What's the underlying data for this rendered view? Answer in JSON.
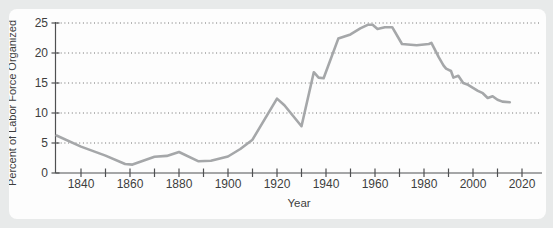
{
  "colors": {
    "page_background": "#e8eaea",
    "card_background": "#fdfdfd",
    "axis": "#4f5052",
    "grid_dots": "#6f6f6f",
    "text": "#3e3e3e",
    "series_line": "#a5a7a9"
  },
  "chart_data": {
    "type": "line",
    "title": "",
    "xlabel": "Year",
    "ylabel": "Percent of Labor Force Organized",
    "xlim": [
      1829,
      2028
    ],
    "ylim": [
      0,
      25
    ],
    "y_ticks": [
      0,
      5,
      10,
      15,
      20,
      25
    ],
    "x_minor_ticks": {
      "start": 1840,
      "end": 2020,
      "step": 10
    },
    "x_tick_labels": [
      1840,
      1860,
      1880,
      1900,
      1920,
      1940,
      1960,
      1980,
      2000,
      2020
    ],
    "grid": "horizontal dotted line at each y tick above 0",
    "legend_position": "none",
    "series": [
      {
        "name": "Percent of labor force organized",
        "color": "#a5a7a9",
        "points": [
          [
            1830,
            6.25
          ],
          [
            1840,
            4.4
          ],
          [
            1850,
            2.9
          ],
          [
            1858,
            1.5
          ],
          [
            1861,
            1.4
          ],
          [
            1870,
            2.7
          ],
          [
            1875,
            2.85
          ],
          [
            1880,
            3.5
          ],
          [
            1888,
            1.95
          ],
          [
            1893,
            2.05
          ],
          [
            1900,
            2.75
          ],
          [
            1905,
            4.0
          ],
          [
            1910,
            5.55
          ],
          [
            1920,
            12.4
          ],
          [
            1923,
            11.3
          ],
          [
            1930,
            7.8
          ],
          [
            1935,
            16.8
          ],
          [
            1937,
            15.9
          ],
          [
            1939,
            15.8
          ],
          [
            1945,
            22.4
          ],
          [
            1950,
            23.1
          ],
          [
            1954,
            24.1
          ],
          [
            1957,
            24.7
          ],
          [
            1959,
            24.7
          ],
          [
            1961,
            24.0
          ],
          [
            1964,
            24.3
          ],
          [
            1967,
            24.3
          ],
          [
            1971,
            21.5
          ],
          [
            1977,
            21.3
          ],
          [
            1982,
            21.5
          ],
          [
            1983,
            21.7
          ],
          [
            1986,
            19.3
          ],
          [
            1988,
            17.9
          ],
          [
            1989,
            17.4
          ],
          [
            1991,
            17.0
          ],
          [
            1992,
            15.9
          ],
          [
            1994,
            16.2
          ],
          [
            1996,
            15.0
          ],
          [
            1998,
            14.7
          ],
          [
            2000,
            14.2
          ],
          [
            2002,
            13.7
          ],
          [
            2004,
            13.3
          ],
          [
            2006,
            12.5
          ],
          [
            2008,
            12.8
          ],
          [
            2010,
            12.2
          ],
          [
            2012,
            11.9
          ],
          [
            2015,
            11.8
          ]
        ]
      }
    ]
  }
}
